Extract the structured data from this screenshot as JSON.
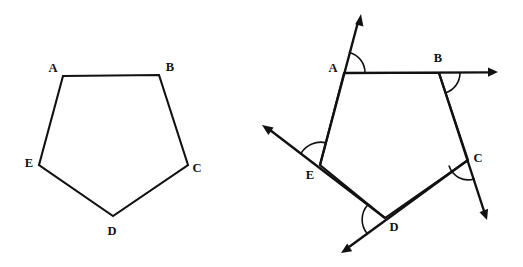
{
  "figure": {
    "background_color": "#ffffff",
    "stroke_color": "#111111",
    "width": 523,
    "height": 267
  },
  "left_figure": {
    "name": "plain-pentagon",
    "vertices": [
      {
        "label": "A",
        "x": 63,
        "y": 76,
        "label_x": 53,
        "label_y": 69
      },
      {
        "label": "B",
        "x": 159,
        "y": 75,
        "label_x": 170,
        "label_y": 68
      },
      {
        "label": "C",
        "x": 188,
        "y": 165,
        "label_x": 197,
        "label_y": 169
      },
      {
        "label": "D",
        "x": 113,
        "y": 216,
        "label_x": 112,
        "label_y": 232
      },
      {
        "label": "E",
        "x": 39,
        "y": 165,
        "label_x": 29,
        "label_y": 164
      }
    ]
  },
  "right_figure": {
    "name": "pentagon-with-exterior-rays",
    "vertices": [
      {
        "label": "A",
        "x": 344,
        "y": 73,
        "label_x": 333,
        "label_y": 69
      },
      {
        "label": "B",
        "x": 439,
        "y": 73,
        "label_x": 438,
        "label_y": 59
      },
      {
        "label": "C",
        "x": 468,
        "y": 160,
        "label_x": 478,
        "label_y": 159
      },
      {
        "label": "D",
        "x": 385,
        "y": 218,
        "label_x": 394,
        "label_y": 228
      },
      {
        "label": "E",
        "x": 320,
        "y": 165,
        "label_x": 310,
        "label_y": 176
      }
    ],
    "rays": [
      {
        "name": "ray-at-A",
        "from_label": "A",
        "tip_x": 361,
        "tip_y": 14
      },
      {
        "name": "ray-at-B",
        "from_label": "B",
        "tip_x": 498,
        "tip_y": 72
      },
      {
        "name": "ray-at-C",
        "from_label": "C",
        "tip_x": 487,
        "tip_y": 220
      },
      {
        "name": "ray-at-D",
        "from_label": "D",
        "tip_x": 341,
        "tip_y": 253
      },
      {
        "name": "ray-at-E",
        "from_label": "E",
        "tip_x": 262,
        "tip_y": 125
      }
    ],
    "angle_marks": [
      {
        "name": "exterior-angle-A",
        "vertex_label": "A",
        "radius": 21
      },
      {
        "name": "exterior-angle-B",
        "vertex_label": "B",
        "radius": 21
      },
      {
        "name": "exterior-angle-C",
        "vertex_label": "C",
        "radius": 20
      },
      {
        "name": "exterior-angle-D",
        "vertex_label": "D",
        "radius": 22
      },
      {
        "name": "exterior-angle-E",
        "vertex_label": "E",
        "radius": 23
      }
    ]
  }
}
